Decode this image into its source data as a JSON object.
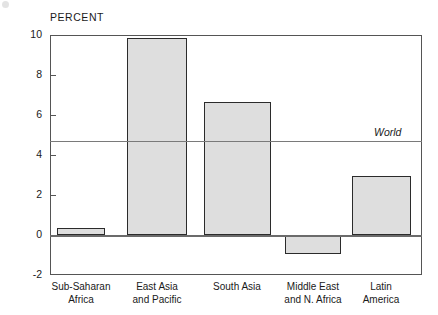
{
  "chart_data": {
    "type": "bar",
    "title": "",
    "subtitle": "",
    "xlabel": "",
    "ylabel": "PERCENT",
    "ylim": [
      -2,
      10
    ],
    "yticks": [
      10,
      8,
      6,
      4,
      2,
      0,
      -2
    ],
    "ytick_labels": [
      "10",
      "8",
      "6",
      "4",
      "2",
      "0",
      "-2"
    ],
    "grid": false,
    "legend": "none",
    "categories": [
      "Sub-Saharan\nAfrica",
      "East Asia\nand Pacific",
      "South Asia",
      "Middle East\nand N. Africa",
      "Latin\nAmerica"
    ],
    "values": [
      0.35,
      9.85,
      6.65,
      -0.95,
      2.95
    ],
    "annotations": [
      {
        "name": "world-reference-line",
        "label": "World",
        "value": 4.7
      }
    ],
    "colors": {
      "bar_fill": "#dedede",
      "bar_stroke": "#2b2b2b",
      "axis": "#555555",
      "zero_line": "#6b6b6b",
      "world_line": "#7a7a7a",
      "text": "#1a1a1a",
      "background": "#ffffff"
    }
  }
}
